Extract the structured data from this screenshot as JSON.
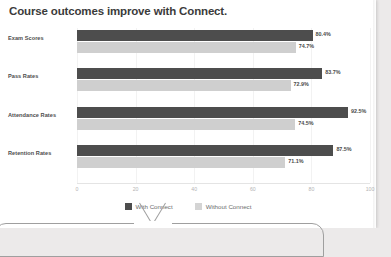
{
  "chart_data": {
    "type": "bar",
    "orientation": "horizontal",
    "title": "Course outcomes improve with Connect.",
    "xlabel": "",
    "ylabel": "",
    "xlim": [
      0,
      100
    ],
    "xticks": [
      "0",
      "20",
      "40",
      "60",
      "80",
      "100"
    ],
    "grid": true,
    "legend_position": "bottom-center",
    "categories": [
      "Exam Scores",
      "Pass Rates",
      "Attendance Rates",
      "Retention Rates"
    ],
    "series": [
      {
        "name": "With Connect",
        "color": "#4d4d4d",
        "values": [
          80.4,
          83.7,
          92.5,
          87.5
        ],
        "labels": [
          "80.4%",
          "83.7%",
          "92.5%",
          "87.5%"
        ]
      },
      {
        "name": "Without Connect",
        "color": "#cfcfcf",
        "values": [
          74.7,
          72.9,
          74.5,
          71.1
        ],
        "labels": [
          "74.7%",
          "72.9%",
          "74.5%",
          "71.1%"
        ]
      }
    ]
  },
  "colors": {
    "with_connect": "#4d4d4d",
    "without_connect": "#cfcfcf",
    "title_text": "#3b3b3b",
    "page_background": "#eceaea",
    "card_background": "#ffffff"
  }
}
